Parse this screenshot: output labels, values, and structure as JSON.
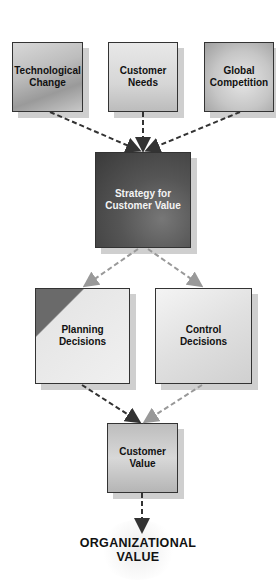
{
  "diagram": {
    "inputs": [
      {
        "id": "technological-change",
        "label_line1": "Technological",
        "label_line2": "Change"
      },
      {
        "id": "customer-needs",
        "label_line1": "Customer",
        "label_line2": "Needs"
      },
      {
        "id": "global-competition",
        "label_line1": "Global",
        "label_line2": "Competition"
      }
    ],
    "strategy": {
      "label_line1": "Strategy for",
      "label_line2": "Customer Value"
    },
    "decisions": [
      {
        "id": "planning-decisions",
        "label_line1": "Planning",
        "label_line2": "Decisions"
      },
      {
        "id": "control-decisions",
        "label_line1": "Control",
        "label_line2": "Decisions"
      }
    ],
    "customer_value": {
      "label_line1": "Customer",
      "label_line2": "Value"
    },
    "outcome": {
      "label_line1": "ORGANIZATIONAL",
      "label_line2": "VALUE"
    },
    "edges": [
      {
        "from": "technological-change",
        "to": "strategy",
        "style": "dashed-dark"
      },
      {
        "from": "customer-needs",
        "to": "strategy",
        "style": "dashed-dark"
      },
      {
        "from": "global-competition",
        "to": "strategy",
        "style": "dashed-dark"
      },
      {
        "from": "strategy",
        "to": "planning-decisions",
        "style": "dashed-light"
      },
      {
        "from": "strategy",
        "to": "control-decisions",
        "style": "dashed-light"
      },
      {
        "from": "planning-decisions",
        "to": "customer-value",
        "style": "dashed-dark"
      },
      {
        "from": "control-decisions",
        "to": "customer-value",
        "style": "dashed-light"
      },
      {
        "from": "customer-value",
        "to": "organizational-value",
        "style": "dashed-dark"
      }
    ]
  }
}
